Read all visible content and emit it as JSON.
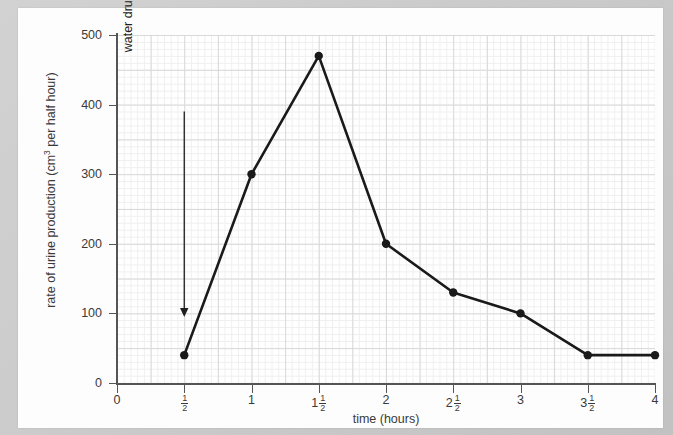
{
  "chart_data": {
    "type": "line",
    "title": "",
    "xlabel": "time (hours)",
    "ylabel": "rate of urine production (cm³ per half hour)",
    "ylabel_parts": {
      "prefix": "rate of urine production (cm",
      "sup": "3",
      "suffix": " per half hour)"
    },
    "x": [
      0.5,
      1,
      1.5,
      2,
      2.5,
      3,
      3.5,
      4
    ],
    "values": [
      40,
      300,
      470,
      200,
      130,
      100,
      40,
      40
    ],
    "points": [
      {
        "x": 0.5,
        "y": 40
      },
      {
        "x": 1,
        "y": 300
      },
      {
        "x": 1.5,
        "y": 470
      },
      {
        "x": 2,
        "y": 200
      },
      {
        "x": 2.5,
        "y": 130
      },
      {
        "x": 3,
        "y": 100
      },
      {
        "x": 3.5,
        "y": 40
      },
      {
        "x": 4,
        "y": 40
      }
    ],
    "xlim": [
      0,
      4
    ],
    "ylim": [
      0,
      500
    ],
    "yticks": [
      0,
      100,
      200,
      300,
      400,
      500
    ],
    "ytick_labels": [
      "0",
      "100",
      "200",
      "300",
      "400",
      "500"
    ],
    "xticks": [
      0,
      0.5,
      1,
      1.5,
      2,
      2.5,
      3,
      3.5,
      4
    ],
    "xtick_labels": [
      {
        "whole": "0",
        "num": "",
        "den": ""
      },
      {
        "whole": "",
        "num": "1",
        "den": "2"
      },
      {
        "whole": "1",
        "num": "",
        "den": ""
      },
      {
        "whole": "1",
        "num": "1",
        "den": "2"
      },
      {
        "whole": "2",
        "num": "",
        "den": ""
      },
      {
        "whole": "2",
        "num": "1",
        "den": "2"
      },
      {
        "whole": "3",
        "num": "",
        "den": ""
      },
      {
        "whole": "3",
        "num": "1",
        "den": "2"
      },
      {
        "whole": "4",
        "num": "",
        "den": ""
      }
    ],
    "grid": true,
    "grid_minor_step_x": 0.05,
    "grid_minor_step_y": 10,
    "grid_major_step_x": 0.25,
    "grid_major_step_y": 50,
    "legend": null,
    "annotations": [
      {
        "text": "water drunk",
        "x": 0.5,
        "arrow_from_y": 390,
        "arrow_to_y": 95,
        "orientation": "vertical",
        "arrow": "down"
      }
    ],
    "line_color": "#1a1a1a",
    "marker_color": "#1a1a1a",
    "marker": "circle"
  },
  "colors": {
    "page_background": "#c9c9c9",
    "paper": "#fdfdfd",
    "axis": "#555555",
    "grid_major": "#d9d9d9",
    "grid_minor": "#efefef",
    "text": "#3a3a3a",
    "data": "#1a1a1a"
  }
}
